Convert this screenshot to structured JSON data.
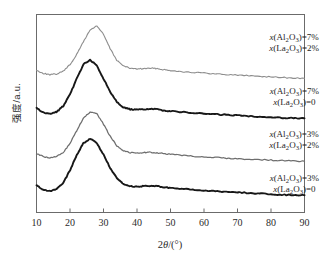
{
  "chart_data": {
    "type": "line",
    "title": "",
    "xlabel": "2θ/(°)",
    "ylabel": "强度/a.u.",
    "xlim": [
      10,
      90
    ],
    "xticks": [
      10,
      20,
      30,
      40,
      50,
      60,
      70,
      80,
      90
    ],
    "xtick_labels": [
      "10",
      "20",
      "30",
      "40",
      "50",
      "60",
      "70",
      "80",
      "90"
    ],
    "yticks": [],
    "ytick_labels": [],
    "grid": false,
    "legend_position": "inline-right",
    "note": "XRD patterns — broad amorphous halo centred near 2θ = 26–28° with weak secondary bump near 43°; four stacked offset traces.",
    "series": [
      {
        "name": "x(Al2O3)=7%, x(La2O3)=2%",
        "label_line1": "x(Al2O3)=7%",
        "label_line2": "x(La2O3)=2%",
        "color": "#8d8d8d",
        "stroke_width": 1.1,
        "peak_2theta": 26.5,
        "x": [
          10,
          12,
          14,
          16,
          18,
          20,
          22,
          24,
          26,
          28,
          30,
          32,
          34,
          36,
          38,
          40,
          42,
          44,
          46,
          48,
          50,
          54,
          58,
          62,
          66,
          70,
          74,
          78,
          82,
          86,
          90
        ],
        "y": [
          0.3,
          0.26,
          0.24,
          0.25,
          0.29,
          0.38,
          0.52,
          0.7,
          0.86,
          0.92,
          0.8,
          0.6,
          0.44,
          0.36,
          0.33,
          0.32,
          0.325,
          0.33,
          0.325,
          0.31,
          0.3,
          0.28,
          0.27,
          0.255,
          0.245,
          0.235,
          0.225,
          0.215,
          0.205,
          0.195,
          0.19
        ]
      },
      {
        "name": "x(Al2O3)=7%, x(La2O3)=0",
        "label_line1": "x(Al2O3)=7%",
        "label_line2": "x(La2O3)=0",
        "color": "#171717",
        "stroke_width": 1.9,
        "peak_2theta": 25.5,
        "x": [
          10,
          12,
          14,
          16,
          18,
          20,
          22,
          24,
          26,
          28,
          30,
          32,
          34,
          36,
          38,
          40,
          42,
          44,
          46,
          48,
          50,
          54,
          58,
          62,
          66,
          70,
          74,
          78,
          82,
          86,
          90
        ],
        "y": [
          0.33,
          0.27,
          0.25,
          0.28,
          0.36,
          0.52,
          0.74,
          0.94,
          1.0,
          0.92,
          0.74,
          0.56,
          0.42,
          0.34,
          0.315,
          0.31,
          0.315,
          0.32,
          0.315,
          0.3,
          0.29,
          0.275,
          0.26,
          0.25,
          0.24,
          0.23,
          0.22,
          0.21,
          0.2,
          0.195,
          0.19
        ]
      },
      {
        "name": "x(Al2O3)=3%, x(La2O3)=2%",
        "label_line1": "x(Al2O3)=3%",
        "label_line2": "x(La2O3)=2%",
        "color": "#6e6e6e",
        "stroke_width": 1.25,
        "peak_2theta": 26.0,
        "x": [
          10,
          12,
          14,
          16,
          18,
          20,
          22,
          24,
          26,
          28,
          30,
          32,
          34,
          36,
          38,
          40,
          42,
          44,
          46,
          48,
          50,
          54,
          58,
          62,
          66,
          70,
          74,
          78,
          82,
          86,
          90
        ],
        "y": [
          0.31,
          0.27,
          0.25,
          0.27,
          0.33,
          0.45,
          0.63,
          0.8,
          0.89,
          0.86,
          0.72,
          0.55,
          0.42,
          0.35,
          0.325,
          0.32,
          0.325,
          0.33,
          0.32,
          0.31,
          0.3,
          0.285,
          0.27,
          0.26,
          0.25,
          0.24,
          0.23,
          0.225,
          0.215,
          0.21,
          0.205
        ]
      },
      {
        "name": "x(Al2O3)=3%, x(La2O3)=0",
        "label_line1": "x(Al2O3)=3%",
        "label_line2": "x(La2O3)=0",
        "color": "#171717",
        "stroke_width": 1.9,
        "peak_2theta": 26.0,
        "x": [
          10,
          12,
          14,
          16,
          18,
          20,
          22,
          24,
          26,
          28,
          30,
          32,
          34,
          36,
          38,
          40,
          42,
          44,
          46,
          48,
          50,
          54,
          58,
          62,
          66,
          70,
          74,
          78,
          82,
          86,
          90
        ],
        "y": [
          0.34,
          0.28,
          0.26,
          0.29,
          0.38,
          0.55,
          0.76,
          0.93,
          0.99,
          0.93,
          0.77,
          0.58,
          0.44,
          0.355,
          0.33,
          0.325,
          0.33,
          0.335,
          0.33,
          0.315,
          0.305,
          0.29,
          0.275,
          0.265,
          0.255,
          0.245,
          0.235,
          0.225,
          0.215,
          0.21,
          0.205
        ]
      }
    ]
  },
  "axes": {
    "x_title_prefix": "2",
    "x_title_symbol": "θ",
    "x_title_suffix": "/(°)",
    "y_title": "强度/a.u."
  },
  "annotations": [
    {
      "id": "ann-1",
      "var": "x",
      "species1": "(Al",
      "sub1": "2",
      "ox1": "O",
      "sub2": "3",
      "tail1": ")=7%",
      "var2": "x",
      "species2": "(La",
      "sub3": "2",
      "ox2": "O",
      "sub4": "3",
      "tail2": ")=2%"
    },
    {
      "id": "ann-2",
      "var": "x",
      "species1": "(Al",
      "sub1": "2",
      "ox1": "O",
      "sub2": "3",
      "tail1": ")=7%",
      "var2": "x",
      "species2": "(La",
      "sub3": "2",
      "ox2": "O",
      "sub4": "3",
      "tail2": ")=0"
    },
    {
      "id": "ann-3",
      "var": "x",
      "species1": "(Al",
      "sub1": "2",
      "ox1": "O",
      "sub2": "3",
      "tail1": ")=3%",
      "var2": "x",
      "species2": "(La",
      "sub3": "2",
      "ox2": "O",
      "sub4": "3",
      "tail2": ")=2%"
    },
    {
      "id": "ann-4",
      "var": "x",
      "species1": "(Al",
      "sub1": "2",
      "ox1": "O",
      "sub2": "3",
      "tail1": ")=3%",
      "var2": "x",
      "species2": "(La",
      "sub3": "2",
      "ox2": "O",
      "sub4": "3",
      "tail2": ")=0"
    }
  ]
}
